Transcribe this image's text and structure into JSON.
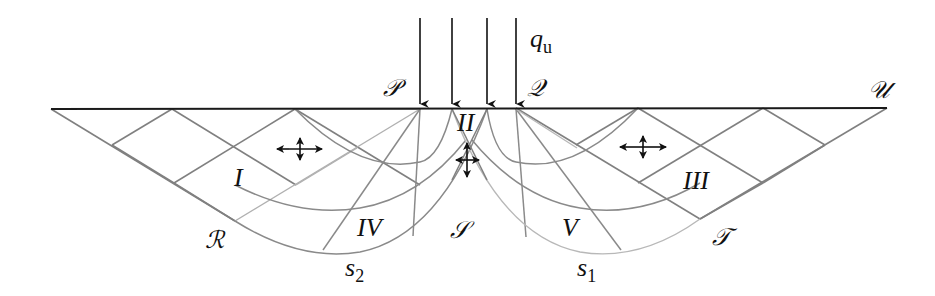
{
  "diagram": {
    "load_label": {
      "main": "q",
      "sub": "u"
    },
    "point_labels": {
      "P": "𝒫",
      "Q": "𝒬",
      "U": "𝒰",
      "R": "ℛ",
      "S": "𝒮",
      "T": "𝒯"
    },
    "region_labels": {
      "I": "I",
      "II": "II",
      "III": "III",
      "IV": "IV",
      "V": "V"
    },
    "slip_labels": {
      "s2": {
        "main": "s",
        "sub": "2"
      },
      "s1": {
        "main": "s",
        "sub": "1"
      }
    },
    "load_arrows_count": 4,
    "colors": {
      "surface": "#1a1a1a",
      "grid_dark": "#7a7a7a",
      "grid_light": "#b4b4b4",
      "arrow": "#111111"
    }
  }
}
